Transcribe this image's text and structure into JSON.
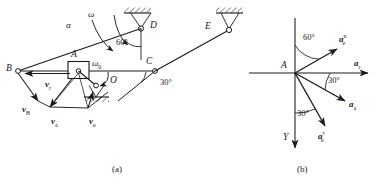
{
  "figure": {
    "caption_a": "(a)",
    "caption_b": "(b)"
  },
  "mechanism": {
    "points": {
      "B": "B",
      "A": "A",
      "C": "C",
      "D": "D",
      "E": "E",
      "O": "O"
    },
    "kinematics": {
      "alpha": "α",
      "omega": "ω",
      "omega0": "ω",
      "omega0_sub": "0"
    },
    "angles": {
      "at_D": "60°",
      "at_C": "30°"
    },
    "velocity_vectors": [
      {
        "name": "v",
        "sub": "r",
        "label": "v_r"
      },
      {
        "name": "v",
        "sub": "B",
        "label": "v_B"
      },
      {
        "name": "v",
        "sub": "a",
        "label": "v_a"
      },
      {
        "name": "v",
        "sub": "e",
        "label": "v_e"
      }
    ]
  },
  "acceleration_diagram": {
    "origin_label": "A",
    "axis_y_label": "Y",
    "angles": {
      "upper": "60°",
      "middle": "30°",
      "lower": "30°"
    },
    "vectors": [
      {
        "name": "a",
        "sub": "e",
        "sup": "n",
        "label": "a_e^n"
      },
      {
        "name": "a",
        "sub": "r",
        "sup": "",
        "label": "a_r"
      },
      {
        "name": "a",
        "sub": "a",
        "sup": "",
        "label": "a_a"
      },
      {
        "name": "a",
        "sub": "e",
        "sup": "τ",
        "label": "a_e^tau"
      }
    ]
  },
  "colors": {
    "ink": "#1a1a1a",
    "paper": "#ffffff"
  }
}
